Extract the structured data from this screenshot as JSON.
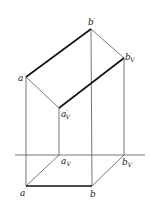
{
  "diagram": {
    "points": {
      "b_prime": {
        "label": "b",
        "sup": "′",
        "sub": ""
      },
      "bV_prime": {
        "label": "b",
        "sup": "′",
        "sub": "V"
      },
      "a_prime": {
        "label": "a",
        "sup": "′",
        "sub": ""
      },
      "aV_prime": {
        "label": "a",
        "sup": "′",
        "sub": "V"
      },
      "aV": {
        "label": "a",
        "sub": "V"
      },
      "bV": {
        "label": "b",
        "sub": "V"
      },
      "a": {
        "label": "a"
      },
      "b": {
        "label": "b"
      }
    },
    "colors": {
      "thick_line": "#111111",
      "thin_line": "#555555"
    }
  }
}
